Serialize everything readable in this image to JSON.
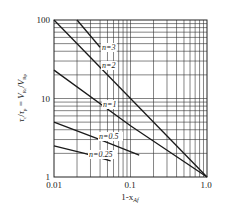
{
  "chart_data": {
    "type": "line",
    "title": "",
    "xlabel": "1-x_Af",
    "ylabel": "τc/τp = V_Rc/V_Rp",
    "xscale": "log",
    "yscale": "log",
    "xlim": [
      0.01,
      1.0
    ],
    "ylim": [
      1,
      100
    ],
    "grid": true,
    "x_ticks": [
      "0.01",
      "0.1",
      "1.0"
    ],
    "y_ticks": [
      "1",
      "10",
      "100"
    ],
    "series": [
      {
        "name": "n=3",
        "x": [
          0.02,
          0.04
        ],
        "values": [
          100,
          45
        ]
      },
      {
        "name": "n=2",
        "x": [
          0.01,
          0.1,
          1.0
        ],
        "values": [
          100,
          10,
          1
        ]
      },
      {
        "name": "n=1",
        "x": [
          0.01,
          0.1,
          1.0
        ],
        "values": [
          23,
          4.5,
          1
        ]
      },
      {
        "name": "n=0.5",
        "x": [
          0.01,
          0.04,
          0.13
        ],
        "values": [
          5,
          3,
          1.9
        ]
      },
      {
        "name": "n=0.25",
        "x": [
          0.01,
          0.025,
          0.055
        ],
        "values": [
          2.5,
          2.0,
          1.6
        ]
      }
    ],
    "annotations": [
      "n=3",
      "n=2",
      "n=1",
      "n=0.5",
      "n=0.25"
    ]
  },
  "labels": {
    "x_tick_0": "0.01",
    "x_tick_1": "0.1",
    "x_tick_2": "1.0",
    "y_tick_0": "1",
    "y_tick_1": "10",
    "y_tick_2": "100",
    "xlabel_main": "1-x",
    "xlabel_sub": "Af",
    "ylabel_top": "τ",
    "ylabel_eq": "="
  },
  "colors": {
    "line": "#1a1a1a",
    "grid": "#333333",
    "background": "#ffffff"
  }
}
